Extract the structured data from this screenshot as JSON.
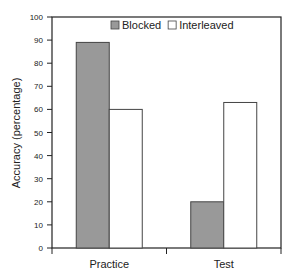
{
  "chart_data": {
    "type": "bar",
    "title": "",
    "xlabel": "",
    "ylabel": "Accuracy (percentage)",
    "ylim": [
      0,
      100
    ],
    "yticks": [
      0,
      10,
      20,
      30,
      40,
      50,
      60,
      70,
      80,
      90,
      100
    ],
    "categories": [
      "Practice",
      "Test"
    ],
    "series": [
      {
        "name": "Blocked",
        "values": [
          89,
          20
        ],
        "color": "#999999"
      },
      {
        "name": "Interleaved",
        "values": [
          60,
          63
        ],
        "color": "#ffffff"
      }
    ],
    "legend_position": "top-inside",
    "grid": false
  }
}
